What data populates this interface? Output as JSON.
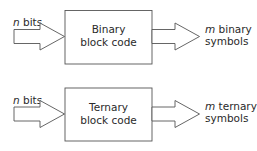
{
  "diagram": {
    "blocks": [
      {
        "id": "binary",
        "title_line1": "Binary",
        "title_line2": "block code",
        "input": {
          "var": "n",
          "text": " bits"
        },
        "output": {
          "var": "m",
          "line1": " binary",
          "line2": "symbols"
        }
      },
      {
        "id": "ternary",
        "title_line1": "Ternary",
        "title_line2": "block code",
        "input": {
          "var": "n",
          "text": " bits"
        },
        "output": {
          "var": "m",
          "line1": " ternary",
          "line2": "symbols"
        }
      }
    ],
    "colors": {
      "stroke": "#555555",
      "text": "#2a2a2a",
      "background": "#ffffff"
    }
  }
}
